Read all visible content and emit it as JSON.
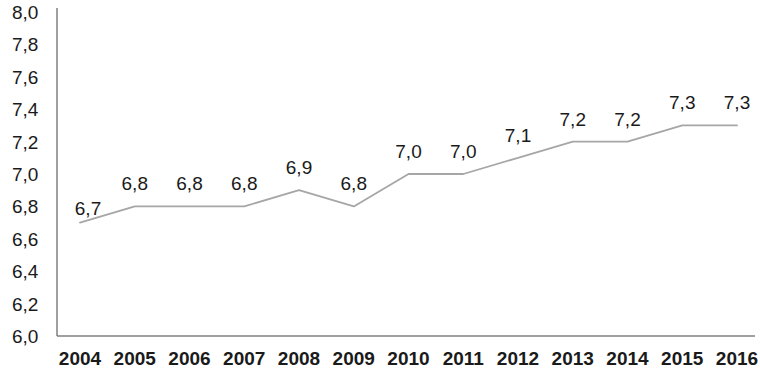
{
  "chart_data": {
    "type": "line",
    "title": "",
    "subtitle": "",
    "xlabel": "",
    "ylabel": "",
    "categories": [
      "2004",
      "2005",
      "2006",
      "2007",
      "2008",
      "2009",
      "2010",
      "2011",
      "2012",
      "2013",
      "2014",
      "2015",
      "2016"
    ],
    "values": [
      6.7,
      6.8,
      6.8,
      6.8,
      6.9,
      6.8,
      7.0,
      7.0,
      7.1,
      7.2,
      7.2,
      7.3,
      7.3
    ],
    "point_labels": [
      "6,7",
      "6,8",
      "6,8",
      "6,8",
      "6,9",
      "6,8",
      "7,0",
      "7,0",
      "7,1",
      "7,2",
      "7,2",
      "7,3",
      "7,3"
    ],
    "ylim": [
      6.0,
      8.0
    ],
    "ytick_values": [
      8.0,
      7.8,
      7.6,
      7.4,
      7.2,
      7.0,
      6.8,
      6.6,
      6.4,
      6.2,
      6.0
    ],
    "ytick_labels": [
      "8,0",
      "7,8",
      "7,6",
      "7,4",
      "7,2",
      "7,0",
      "6,8",
      "6,6",
      "6,4",
      "6,2",
      "6,0"
    ],
    "grid": false,
    "legend": [],
    "legend_position": "none",
    "line_color": "#a6a6a6",
    "axis_color": "#7f7f7f",
    "text_color": "#1a1a1a"
  }
}
